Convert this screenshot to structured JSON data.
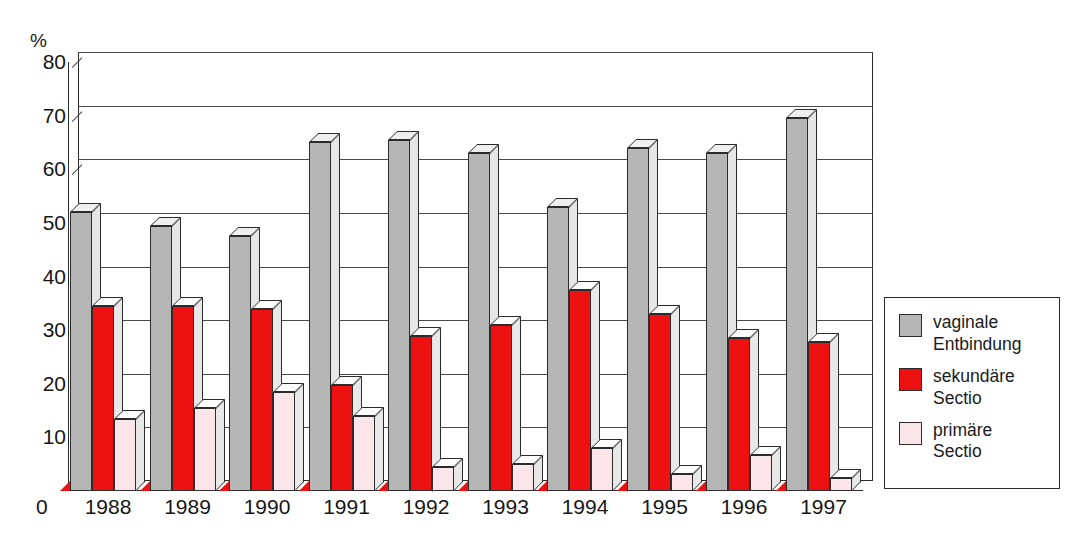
{
  "chart_data": {
    "type": "bar",
    "title": "",
    "subtitle": "",
    "xlabel": "",
    "ylabel": "%",
    "ylim": [
      0,
      80
    ],
    "yticks": [
      0,
      10,
      20,
      30,
      40,
      50,
      60,
      70,
      80
    ],
    "grid": true,
    "legend_position": "right",
    "categories": [
      "1988",
      "1989",
      "1990",
      "1991",
      "1992",
      "1993",
      "1994",
      "1995",
      "1996",
      "1997"
    ],
    "series": [
      {
        "name": "vaginale Entbindung",
        "color": "#b6b6b6",
        "values": [
          52,
          49.5,
          47.5,
          65,
          65.5,
          63,
          53,
          64,
          63,
          69.5
        ]
      },
      {
        "name": "sekundäre Sectio",
        "color": "#ee1111",
        "values": [
          34.5,
          34.5,
          34,
          19.8,
          29,
          31,
          37.5,
          33,
          28.5,
          27.8
        ]
      },
      {
        "name": "primäre Sectio",
        "color": "#fbe5e8",
        "values": [
          13.5,
          15.5,
          18.5,
          14,
          4.5,
          5,
          8,
          3.2,
          6.8,
          2.5
        ]
      }
    ]
  },
  "axis": {
    "unit_label": "%",
    "zero_label": "0",
    "tick_labels": [
      "80",
      "70",
      "60",
      "50",
      "40",
      "30",
      "20",
      "10"
    ]
  },
  "legend": {
    "items": [
      {
        "label": "vaginale\nEntbindung",
        "color": "#b6b6b6",
        "icon": "legend-swatch-gray"
      },
      {
        "label": "sekundäre\nSectio",
        "color": "#ee1111",
        "icon": "legend-swatch-red"
      },
      {
        "label": "primäre\nSectio",
        "color": "#fbe5e8",
        "icon": "legend-swatch-pink"
      }
    ]
  }
}
